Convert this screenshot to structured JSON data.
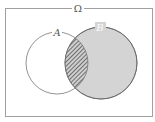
{
  "diagram": {
    "type": "venn",
    "universe_label": "Ω",
    "sets": [
      {
        "label": "A",
        "fill": "none"
      },
      {
        "label": "B",
        "fill": "#d4d4d4"
      }
    ],
    "intersection": {
      "pattern": "diagonal-hatch",
      "colors": [
        "#555555",
        "#d4d4d4"
      ]
    },
    "colors": {
      "border": "#999999",
      "stroke": "#666666",
      "b_fill": "#d4d4d4",
      "hatch": "#555555"
    }
  }
}
